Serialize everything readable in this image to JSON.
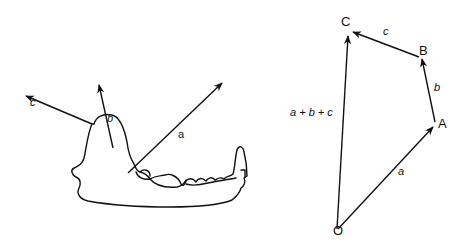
{
  "jaw_diagram": {
    "vectors": [
      {
        "name": "c",
        "label": "c"
      },
      {
        "name": "b",
        "label": "b"
      },
      {
        "name": "a",
        "label": "a"
      }
    ]
  },
  "polygon_diagram": {
    "points": {
      "O": "O",
      "A": "A",
      "B": "B",
      "C": "C"
    },
    "edges": {
      "a": "a",
      "b": "b",
      "c": "c",
      "sum": "a + b + c"
    }
  }
}
